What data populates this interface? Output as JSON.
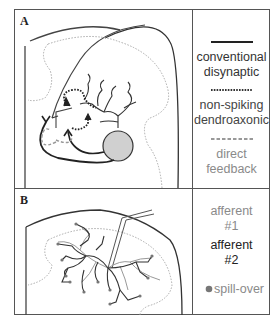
{
  "panels": {
    "a": {
      "label": "A",
      "legend": [
        {
          "line_style": "solid",
          "color": "#222222",
          "lines": [
            "conventional",
            "disynaptic"
          ],
          "text_color": "#333333"
        },
        {
          "line_style": "dotted",
          "color": "#333333",
          "lines": [
            "non-spiking",
            "dendroaxonic"
          ],
          "text_color": "#444444"
        },
        {
          "line_style": "dashed",
          "color": "#999999",
          "lines": [
            "direct",
            "feedback"
          ],
          "text_color": "#8a8a8a"
        }
      ]
    },
    "b": {
      "label": "B",
      "legend": [
        {
          "lines": [
            "afferent",
            "#1"
          ],
          "text_color": "#8a8a8a"
        },
        {
          "lines": [
            "afferent",
            "#2"
          ],
          "text_color": "#222222"
        },
        {
          "marker": "dot",
          "marker_color": "#777777",
          "lines": [
            "spill-over"
          ],
          "text_color": "#8a8a8a"
        }
      ]
    }
  },
  "colors": {
    "frame": "#555555",
    "soma": "#d0d0d0",
    "dotted_boundary": "#aaaaaa"
  }
}
